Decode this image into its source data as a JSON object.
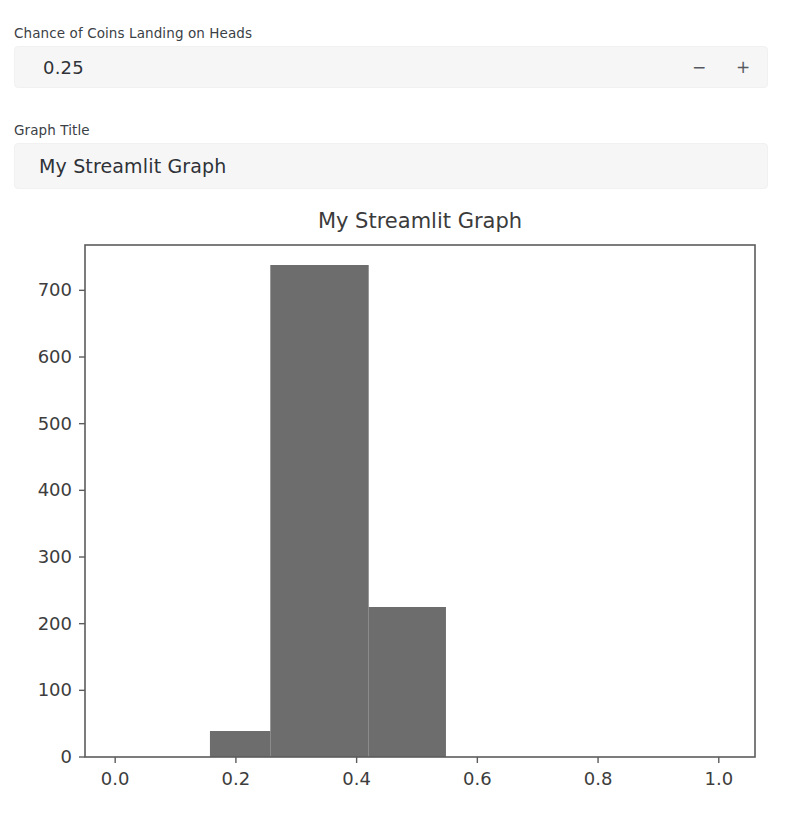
{
  "app": {
    "framework_label": "streamlit"
  },
  "controls": {
    "number_input": {
      "label": "Chance of Coins Landing on Heads",
      "value": "0.25",
      "decrement_label": "−",
      "increment_label": "+"
    },
    "text_input": {
      "label": "Graph Title",
      "value": "My Streamlit Graph",
      "placeholder": "My Streamlit Graph"
    }
  },
  "chart_data": {
    "type": "bar",
    "title": "My Streamlit Graph",
    "xlabel": "",
    "ylabel": "",
    "grid": false,
    "legend": null,
    "xlim": [
      -0.05,
      1.06
    ],
    "ylim": [
      0,
      768
    ],
    "xticks": [
      "0.0",
      "0.2",
      "0.4",
      "0.6",
      "0.8",
      "1.0"
    ],
    "xtick_values": [
      0.0,
      0.2,
      0.4,
      0.6,
      0.8,
      1.0
    ],
    "yticks": [
      "0",
      "100",
      "200",
      "300",
      "400",
      "500",
      "600",
      "700"
    ],
    "ytick_values": [
      0,
      100,
      200,
      300,
      400,
      500,
      600,
      700
    ],
    "bar_color": "#6d6d6d",
    "bins": [
      {
        "left": 0.157,
        "right": 0.257,
        "value": 39
      },
      {
        "left": 0.257,
        "right": 0.42,
        "value": 738
      },
      {
        "left": 0.42,
        "right": 0.548,
        "value": 225
      }
    ],
    "categories": [
      "0.157–0.257",
      "0.257–0.420",
      "0.420–0.548"
    ],
    "values": [
      39,
      738,
      225
    ]
  }
}
